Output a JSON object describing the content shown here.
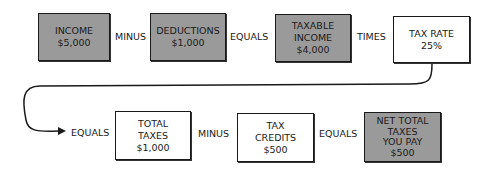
{
  "row1": [
    {
      "lines": [
        "INCOME",
        "$5,000"
      ],
      "style": "gray"
    },
    {
      "op": "MINUS"
    },
    {
      "lines": [
        "DEDUCTIONS",
        "$1,000"
      ],
      "style": "gray"
    },
    {
      "op": "EQUALS"
    },
    {
      "lines": [
        "TAXABLE",
        "INCOME",
        "$4,000"
      ],
      "style": "gray"
    },
    {
      "op": "TIMES"
    },
    {
      "lines": [
        "TAX RATE",
        "25%"
      ],
      "style": "white"
    }
  ],
  "row2": [
    {
      "op": "EQUALS"
    },
    {
      "lines": [
        "TOTAL",
        "TAXES",
        "$1,000"
      ],
      "style": "white"
    },
    {
      "op": "MINUS"
    },
    {
      "lines": [
        "TAX",
        "CREDITS",
        "$500"
      ],
      "style": "white"
    },
    {
      "op": "EQUALS"
    },
    {
      "lines": [
        "NET TOTAL",
        "TAXES",
        "YOU PAY",
        "$500"
      ],
      "style": "gray"
    }
  ],
  "colors": {
    "gray_fill": "#9a9a9a",
    "stroke": "#1a1a1a"
  }
}
